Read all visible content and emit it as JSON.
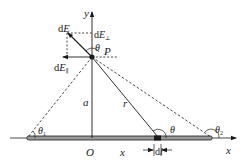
{
  "figure": {
    "colors": {
      "ink": "#1a1a1a",
      "background": "#ffffff"
    },
    "axes": {
      "x_label": "x",
      "y_label": "y",
      "origin_label": "O"
    },
    "point": {
      "label": "P"
    },
    "vectors": {
      "dE": {
        "d": "d",
        "sym": "E"
      },
      "dE_perp": {
        "d": "d",
        "sym": "E",
        "sub": "⊥"
      },
      "dE_par": {
        "d": "d",
        "sym": "E",
        "sub": "∥"
      }
    },
    "lengths": {
      "a": "a",
      "r": "r",
      "x": "x",
      "dl": {
        "d": "d",
        "sym": "l"
      }
    },
    "angles": {
      "theta_at_P": "θ",
      "theta_at_dl": "θ",
      "theta1": {
        "sym": "θ",
        "sub": "1"
      },
      "theta2": {
        "sym": "θ",
        "sub": "2"
      }
    }
  }
}
